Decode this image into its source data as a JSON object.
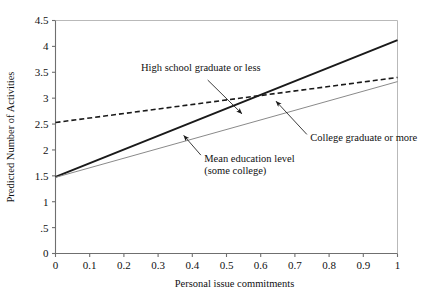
{
  "chart_data": {
    "type": "line",
    "title": "",
    "xlabel": "Personal issue commitments",
    "ylabel": "Predicted Number of Activities",
    "xlim": [
      0,
      1
    ],
    "ylim": [
      0,
      4.5
    ],
    "grid": false,
    "legend_position": "none",
    "xticks": [
      0,
      0.1,
      0.2,
      0.3,
      0.4,
      0.5,
      0.6,
      0.7,
      0.8,
      0.9,
      1
    ],
    "xticklabels": [
      "0",
      "0.1",
      "0.2",
      "0.3",
      "0.4",
      "0.5",
      "0.6",
      "0.7",
      "0.8",
      "0.9",
      "1"
    ],
    "yticks": [
      0,
      0.5,
      1,
      1.5,
      2,
      2.5,
      3,
      3.5,
      4,
      4.5
    ],
    "yticklabels": [
      "0",
      ".5",
      "1",
      "1.5",
      "2",
      "2.5",
      "3",
      "3.5",
      "4",
      "4.5"
    ],
    "x": [
      0,
      1
    ],
    "series": [
      {
        "name": "High school graduate or less",
        "style": "dashed",
        "color": "#1a1a1a",
        "width": 1.6,
        "values": [
          2.53,
          3.4
        ]
      },
      {
        "name": "Mean education level (some college)",
        "style": "solid",
        "color": "#1a1a1a",
        "width": 2.0,
        "values": [
          1.48,
          4.12
        ]
      },
      {
        "name": "College graduate or more",
        "style": "solid",
        "color": "#8a8a8a",
        "width": 1.0,
        "values": [
          1.47,
          3.32
        ]
      }
    ],
    "annotations": [
      {
        "text": "High school graduate or less",
        "lines": [
          "High school graduate or less"
        ],
        "text_x": 0.25,
        "text_y": 3.52,
        "anchor": "start",
        "arrow_from_x": 0.445,
        "arrow_from_y": 3.35,
        "arrow_to_x": 0.545,
        "arrow_to_y": 2.7,
        "target_series": "Mean education level (some college)"
      },
      {
        "text": "College graduate or more",
        "lines": [
          "College graduate or more"
        ],
        "text_x": 0.745,
        "text_y": 2.18,
        "anchor": "start",
        "arrow_from_x": 0.735,
        "arrow_from_y": 2.3,
        "arrow_to_x": 0.645,
        "arrow_to_y": 2.94,
        "target_series": "High school graduate or less"
      },
      {
        "text": "Mean education level (some college)",
        "lines": [
          "Mean education level",
          "(some college)"
        ],
        "text_x": 0.435,
        "text_y": 1.77,
        "anchor": "start",
        "arrow_from_x": 0.425,
        "arrow_from_y": 1.9,
        "arrow_to_x": 0.375,
        "arrow_to_y": 2.28,
        "target_series": "College graduate or more"
      }
    ]
  },
  "axis": {
    "x_title": "Personal issue commitments",
    "y_title": "Predicted Number of Activities"
  },
  "colors": {
    "axis": "#6f6f6f",
    "text": "#111111",
    "series_dark": "#1a1a1a",
    "series_gray": "#8a8a8a",
    "background": "#ffffff"
  }
}
